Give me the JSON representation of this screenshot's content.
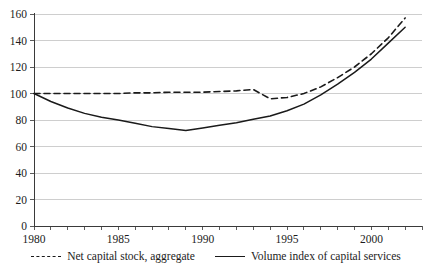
{
  "chart_data": {
    "type": "line",
    "title": "",
    "xlabel": "",
    "ylabel": "",
    "xlim": [
      1980,
      2003
    ],
    "ylim": [
      0,
      160
    ],
    "grid": true,
    "legend_position": "bottom-center",
    "y_ticks": [
      0,
      20,
      40,
      60,
      80,
      100,
      120,
      140,
      160
    ],
    "y_tick_labels": [
      "0",
      "20",
      "40",
      "60",
      "80",
      "100",
      "120",
      "140",
      "160"
    ],
    "x_ticks": [
      1980,
      1981,
      1982,
      1983,
      1984,
      1985,
      1986,
      1987,
      1988,
      1989,
      1990,
      1991,
      1992,
      1993,
      1994,
      1995,
      1996,
      1997,
      1998,
      1999,
      2000,
      2001,
      2002,
      2003
    ],
    "x_tick_labels": [
      {
        "value": 1980,
        "label": "1980"
      },
      {
        "value": 1985,
        "label": "1985"
      },
      {
        "value": 1990,
        "label": "1990"
      },
      {
        "value": 1995,
        "label": "1995"
      },
      {
        "value": 2000,
        "label": "2000"
      }
    ],
    "x": [
      1980,
      1981,
      1982,
      1983,
      1984,
      1985,
      1986,
      1987,
      1988,
      1989,
      1990,
      1991,
      1992,
      1993,
      1994,
      1995,
      1996,
      1997,
      1998,
      1999,
      2000,
      2001,
      2002
    ],
    "series": [
      {
        "name": "Net capital stock, aggregate",
        "style": "dashed",
        "color": "#1a1a1a",
        "values": [
          100,
          100,
          100,
          100,
          100,
          100,
          100.5,
          100.5,
          101,
          101,
          101,
          101.5,
          102,
          103,
          96,
          97,
          100,
          105,
          112,
          120,
          130,
          142,
          157
        ]
      },
      {
        "name": "Volume index of capital services",
        "style": "solid",
        "color": "#1a1a1a",
        "values": [
          100,
          94,
          89,
          85,
          82,
          80,
          77.5,
          75,
          73.5,
          72,
          74,
          76,
          78,
          80.5,
          83,
          87,
          92,
          99,
          107,
          116,
          126,
          138,
          150
        ]
      }
    ]
  },
  "legend": {
    "entries": [
      {
        "label": "Net capital stock, aggregate",
        "style": "dashed"
      },
      {
        "label": "Volume index of capital services",
        "style": "solid"
      }
    ]
  }
}
